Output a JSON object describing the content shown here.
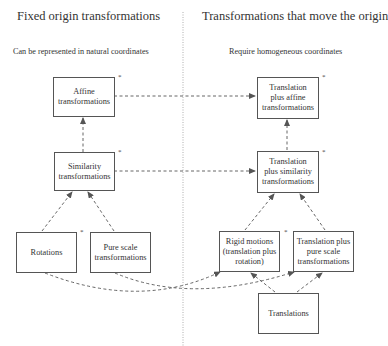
{
  "left_column": {
    "title": "Fixed origin transformations",
    "subtitle": "Can be represented in natural coordinates"
  },
  "right_column": {
    "title": "Transformations that move the origin",
    "subtitle": "Require homogeneous coordinates"
  },
  "nodes": {
    "affine": {
      "label_lines": [
        "Affine",
        "transformations"
      ],
      "starred": true
    },
    "similarity": {
      "label_lines": [
        "Similarity",
        "transformations"
      ],
      "starred": true
    },
    "rotations": {
      "label_lines": [
        "Rotations"
      ],
      "starred": true
    },
    "pure_scale": {
      "label_lines": [
        "Pure scale",
        "transformations"
      ],
      "starred": false
    },
    "translation_affine": {
      "label_lines": [
        "Translation",
        "plus affine",
        "transformations"
      ],
      "starred": true
    },
    "translation_similarity": {
      "label_lines": [
        "Translation",
        "plus similarity",
        "transformations"
      ],
      "starred": true
    },
    "rigid_motions": {
      "label_lines": [
        "Rigid motions",
        "(translation plus",
        "rotation)"
      ],
      "starred": true
    },
    "translation_pure_scale": {
      "label_lines": [
        "Translation plus",
        "pure scale",
        "transformations"
      ],
      "starred": false
    },
    "translations": {
      "label_lines": [
        "Translations"
      ],
      "starred": false
    }
  },
  "star_symbol": "*",
  "edges": [
    {
      "from": "similarity",
      "to": "affine"
    },
    {
      "from": "rotations",
      "to": "similarity"
    },
    {
      "from": "pure_scale",
      "to": "similarity"
    },
    {
      "from": "affine",
      "to": "translation_affine"
    },
    {
      "from": "similarity",
      "to": "translation_similarity"
    },
    {
      "from": "translation_similarity",
      "to": "translation_affine"
    },
    {
      "from": "rigid_motions",
      "to": "translation_similarity"
    },
    {
      "from": "translation_pure_scale",
      "to": "translation_similarity"
    },
    {
      "from": "rotations",
      "to": "rigid_motions"
    },
    {
      "from": "pure_scale",
      "to": "translation_pure_scale"
    },
    {
      "from": "translations",
      "to": "rigid_motions"
    },
    {
      "from": "translations",
      "to": "translation_pure_scale"
    }
  ],
  "divider_style": "dotted"
}
